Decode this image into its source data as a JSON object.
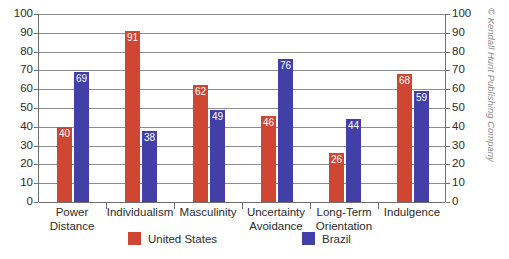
{
  "chart_data": {
    "type": "bar",
    "title": "",
    "subtitle": "",
    "xlabel": "",
    "ylabel": "",
    "ylim": [
      0,
      100
    ],
    "y_ticks": [
      0,
      10,
      20,
      30,
      40,
      50,
      60,
      70,
      80,
      90,
      100
    ],
    "y_axis_right": true,
    "y_ticks_right": [
      0,
      10,
      20,
      30,
      40,
      50,
      60,
      70,
      80,
      90,
      100
    ],
    "grid": true,
    "legend_position": "bottom",
    "categories": [
      "Power Distance",
      "Individualism",
      "Masculinity",
      "Uncertainty Avoidance",
      "Long-Term Orientation",
      "Indulgence"
    ],
    "category_lines": [
      [
        "Power",
        "Distance"
      ],
      [
        "Individualism"
      ],
      [
        "Masculinity"
      ],
      [
        "Uncertainty",
        "Avoidance"
      ],
      [
        "Long-Term",
        "Orientation"
      ],
      [
        "Indulgence"
      ]
    ],
    "series": [
      {
        "name": "United States",
        "color": "#cf4632",
        "values": [
          40,
          91,
          62,
          46,
          26,
          68
        ]
      },
      {
        "name": "Brazil",
        "color": "#4240a6",
        "values": [
          69,
          38,
          49,
          76,
          44,
          59
        ]
      }
    ],
    "data_labels": true
  },
  "legend": {
    "items": [
      {
        "label": "United States",
        "color": "#cf4632"
      },
      {
        "label": "Brazil",
        "color": "#4240a6"
      }
    ]
  },
  "credit": {
    "text": "© Kendall Hunt Publishing Company"
  },
  "colors": {
    "united_states": "#cf4632",
    "brazil": "#4240a6",
    "gridline": "#8d8d8d",
    "axis": "#6f6f6f",
    "text": "#2b2b2b",
    "credit": "#8b8b8b",
    "background": "#ffffff"
  }
}
